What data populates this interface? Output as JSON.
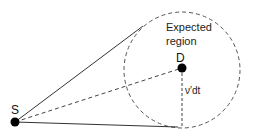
{
  "diagram": {
    "nodes": [
      {
        "id": "S",
        "label": "S",
        "x": 15,
        "y": 122
      },
      {
        "id": "D",
        "label": "D",
        "x": 182,
        "y": 68
      }
    ],
    "region": {
      "label_line1": "Expected",
      "label_line2": "region",
      "center_x": 182,
      "center_y": 70,
      "radius": 58
    },
    "radius_label": "ν′dt",
    "edges": [
      {
        "from": "S",
        "to": "tangent-top",
        "style": "solid"
      },
      {
        "from": "S",
        "to": "tangent-bottom",
        "style": "solid"
      },
      {
        "from": "S",
        "to": "D",
        "style": "dashed"
      },
      {
        "from": "D",
        "to": "circle-bottom",
        "style": "dashed"
      }
    ],
    "colors": {
      "line": "#333333",
      "dot": "#000000"
    }
  }
}
